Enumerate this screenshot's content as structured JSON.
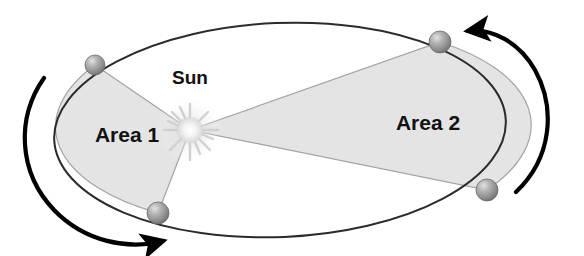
{
  "diagram": {
    "background_color": "#ffffff",
    "labels": {
      "sun": "Sun",
      "area_1": "Area 1",
      "area_2": "Area 2"
    },
    "colors": {
      "orbit_stroke": "#2b2b2b",
      "swept_area_fill": "#e2e2e2",
      "swept_area_stroke": "#9a9a9a",
      "planet_body": "#8c8c8c",
      "planet_highlight": "#d8d8d8",
      "sun_core": "#fbfbfb",
      "sun_glow": "#dddddd",
      "text": "#111111",
      "direction_arrow": "#000000"
    },
    "orbit": {
      "shape": "ellipse",
      "center_x": 280,
      "center_y": 130,
      "radius_x": 226,
      "radius_y": 107,
      "rotation_deg": -2.5,
      "stroke_width": 2
    },
    "sun": {
      "name": "sun-body",
      "x": 190,
      "y": 130,
      "radius": 13,
      "ray_count": 12,
      "label_x": 190,
      "label_y": 78
    },
    "planets": [
      {
        "id": "planet-upper-left",
        "x": 95,
        "y": 65,
        "radius": 10
      },
      {
        "id": "planet-lower-left",
        "x": 158,
        "y": 213,
        "radius": 11
      },
      {
        "id": "planet-upper-right",
        "x": 440,
        "y": 42,
        "radius": 11
      },
      {
        "id": "planet-lower-right",
        "x": 487,
        "y": 190,
        "radius": 11
      }
    ],
    "swept_areas": [
      {
        "id": "area-1",
        "label": "Area 1",
        "label_x": 127,
        "label_y": 134,
        "description": "Sector swept near perihelion between upper-left and lower-left planet positions",
        "vertices": [
          [
            190,
            130
          ],
          [
            95,
            65
          ],
          [
            158,
            213
          ]
        ]
      },
      {
        "id": "area-2",
        "label": "Area 2",
        "label_x": 425,
        "label_y": 122,
        "description": "Sector swept near aphelion between upper-right and lower-right planet positions",
        "vertices": [
          [
            190,
            130
          ],
          [
            440,
            42
          ],
          [
            487,
            190
          ]
        ]
      }
    ],
    "direction_arrows": [
      {
        "id": "arrow-left",
        "side": "left",
        "direction": "clockwise-downward",
        "arrowhead_x": 168,
        "arrowhead_y": 242,
        "stroke_width": 4
      },
      {
        "id": "arrow-right",
        "side": "right",
        "direction": "clockwise-upward",
        "arrowhead_x": 462,
        "arrowhead_y": 30,
        "stroke_width": 4
      }
    ]
  }
}
